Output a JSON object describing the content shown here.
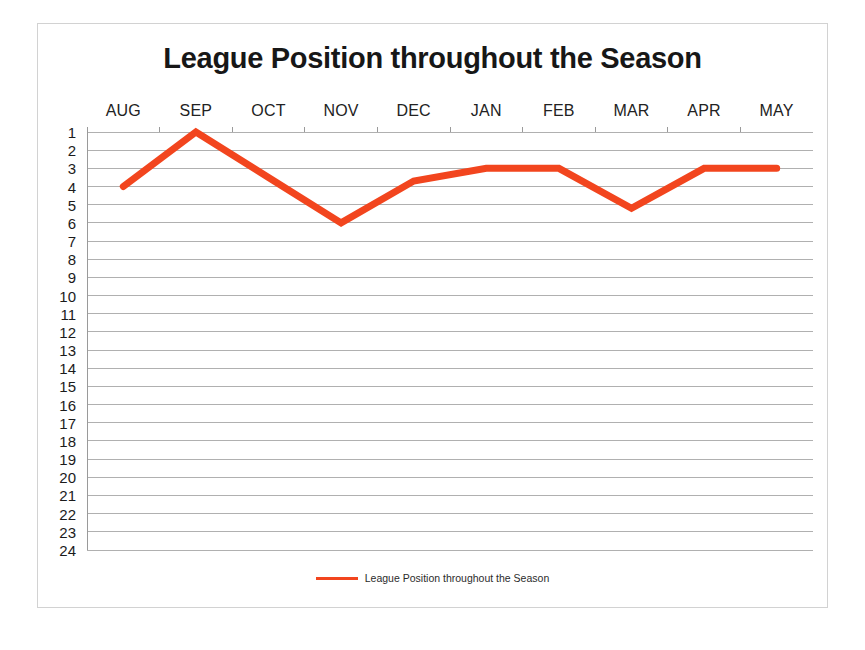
{
  "chart_data": {
    "type": "line",
    "title": "League Position throughout the Season",
    "xlabel": "",
    "ylabel": "",
    "categories": [
      "AUG",
      "SEP",
      "OCT",
      "NOV",
      "DEC",
      "JAN",
      "FEB",
      "MAR",
      "APR",
      "MAY"
    ],
    "values": [
      4,
      1,
      3.5,
      6,
      3.7,
      3,
      3,
      5.2,
      3,
      3
    ],
    "series": [
      {
        "name": "League Position throughout the Season",
        "values": [
          4,
          1,
          3.5,
          6,
          3.7,
          3,
          3,
          5.2,
          3,
          3
        ],
        "color": "#F2451E"
      }
    ],
    "ylim": [
      1,
      24
    ],
    "y_inverted": true,
    "y_ticks": [
      1,
      2,
      3,
      4,
      5,
      6,
      7,
      8,
      9,
      10,
      11,
      12,
      13,
      14,
      15,
      16,
      17,
      18,
      19,
      20,
      21,
      22,
      23,
      24
    ],
    "grid": true,
    "grid_color": "#b0b0b0",
    "markers": false,
    "line_width": 7,
    "legend_position": "bottom",
    "x_axis_label_position": "top"
  },
  "legend": {
    "entries": [
      {
        "label": "League Position throughout the Season",
        "color": "#F2451E"
      }
    ]
  },
  "colors": {
    "series": "#F2451E",
    "grid": "#b0b0b0",
    "frame_border": "#d2d2d2",
    "background": "#ffffff",
    "title_text": "#171717",
    "axis_text": "#1b1b1b"
  }
}
